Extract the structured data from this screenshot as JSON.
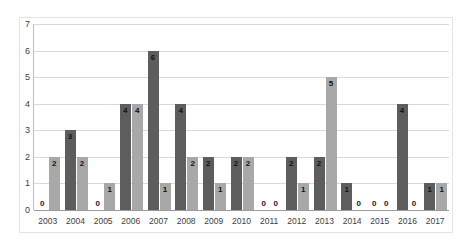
{
  "chart_data": {
    "type": "bar",
    "title": "",
    "subtitle": "",
    "xlabel": "",
    "ylabel": "",
    "ylim": [
      0,
      7
    ],
    "yticks": [
      "0",
      "1",
      "2",
      "3",
      "4",
      "5",
      "6",
      "7"
    ],
    "grid": true,
    "legend_position": "none",
    "categories": [
      "2003",
      "2004",
      "2005",
      "2006",
      "2007",
      "2008",
      "2009",
      "2010",
      "2011",
      "2012",
      "2013",
      "2014",
      "2015",
      "2016",
      "2017"
    ],
    "series": [
      {
        "name": "series-1",
        "color": "#5d5d5d",
        "values": [
          0,
          3,
          0,
          4,
          6,
          4,
          2,
          2,
          0,
          2,
          2,
          1,
          0,
          4,
          1
        ]
      },
      {
        "name": "series-2",
        "color": "#a8a8a8",
        "values": [
          2,
          2,
          1,
          4,
          1,
          2,
          1,
          2,
          0,
          1,
          5,
          0,
          0,
          0,
          1
        ]
      }
    ],
    "data_labels": {
      "2003": [
        "0",
        "2"
      ],
      "2004": [
        "3",
        "2"
      ],
      "2005": [
        "0",
        "1"
      ],
      "2006": [
        "4",
        "4"
      ],
      "2007": [
        "6",
        "1"
      ],
      "2008": [
        "4",
        "2"
      ],
      "2009": [
        "2",
        "1"
      ],
      "2010": [
        "2",
        "2"
      ],
      "2011": [
        "0",
        "0"
      ],
      "2012": [
        "2",
        "1"
      ],
      "2013": [
        "2",
        "5"
      ],
      "2014": [
        "1",
        "0"
      ],
      "2015": [
        "0",
        "0"
      ],
      "2016": [
        "4",
        "0"
      ],
      "2017": [
        "1",
        "1"
      ]
    }
  },
  "colors": {
    "series_1": "#5d5d5d",
    "series_2": "#a8a8a8",
    "gridline": "#d9d9d9",
    "axis": "#9a9a9a",
    "text": "#3d3d3d",
    "background": "#ffffff"
  }
}
